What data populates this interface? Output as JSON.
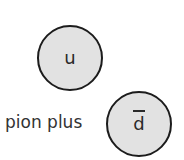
{
  "diagram": {
    "caption": "pion plus",
    "quarks": [
      {
        "label": "u",
        "antiquark": false
      },
      {
        "label": "d",
        "antiquark": true
      }
    ]
  },
  "colors": {
    "circle_fill": "#e2e2e2",
    "circle_stroke": "#1c1c1c",
    "text": "#333333"
  }
}
